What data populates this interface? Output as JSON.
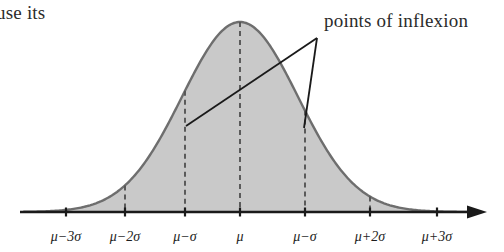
{
  "figure": {
    "kind": "normal-distribution-diagram",
    "fragment_text": "use its",
    "annotation_label": "points of inflexion",
    "colors": {
      "curve_fill": "#c9c9c9",
      "curve_stroke": "#6e6e6e",
      "axis": "#1a1a1a",
      "dashed_line": "#555555",
      "leader_line": "#1a1a1a",
      "text": "#2b2b2b"
    },
    "axis": {
      "y": 212,
      "x_start": 20,
      "x_end": 484,
      "has_right_arrow": true,
      "has_left_arrow": false,
      "tick_height": 9
    },
    "ticks": [
      {
        "label": "μ−3σ",
        "x": 66,
        "dashed": false
      },
      {
        "label": "μ−2σ",
        "x": 125,
        "dashed": true
      },
      {
        "label": "μ−σ",
        "x": 185,
        "dashed": true
      },
      {
        "label": "μ",
        "x": 240,
        "dashed": true
      },
      {
        "label": "μ−σ",
        "x": 305,
        "dashed": true
      },
      {
        "label": "μ+2σ",
        "x": 370,
        "dashed": true
      },
      {
        "label": "μ+3σ",
        "x": 437,
        "dashed": false
      }
    ],
    "curve": {
      "peak_x": 240,
      "peak_y": 22,
      "baseline_y": 212,
      "sigma_px": 58
    },
    "leader_lines": {
      "junction": {
        "x": 317,
        "y": 38
      },
      "targets": [
        {
          "name": "left-inflexion-point",
          "x": 186,
          "y": 126
        },
        {
          "name": "right-inflexion-point",
          "x": 304,
          "y": 128
        }
      ]
    }
  },
  "chart_data": {
    "type": "line",
    "title": "",
    "subtitle": "",
    "xlabel": "",
    "ylabel": "",
    "annotations": [
      "points of inflexion"
    ],
    "categories": [
      "μ−3σ",
      "μ−2σ",
      "μ−σ",
      "μ",
      "μ−σ",
      "μ+2σ",
      "μ+3σ"
    ],
    "x": [
      -3,
      -2,
      -1,
      0,
      1,
      2,
      3
    ],
    "values": [
      0.011,
      0.135,
      0.607,
      1.0,
      0.607,
      0.135,
      0.011
    ],
    "series": [
      {
        "name": "normal probability density",
        "values": [
          0.011,
          0.135,
          0.607,
          1.0,
          0.607,
          0.135,
          0.011
        ]
      }
    ],
    "inflexion_points": [
      {
        "x": -1,
        "y": 0.607,
        "label": "μ−σ"
      },
      {
        "x": 1,
        "y": 0.607,
        "label": "μ+σ"
      }
    ],
    "grid": false,
    "legend": "none",
    "ylim": [
      0,
      1.05
    ],
    "xlim": [
      -3.8,
      4.2
    ],
    "filled": true
  }
}
